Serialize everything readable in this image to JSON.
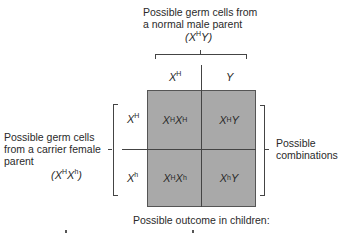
{
  "diagram": {
    "type": "punnett-square",
    "top_label": {
      "line1": "Possible germ cells from",
      "line2": "a normal male parent",
      "genotype": {
        "base1": "(X",
        "sup1": "H",
        "base2": "Y)"
      }
    },
    "column_headers": [
      {
        "base": "X",
        "sup": "H"
      },
      {
        "base": "Y",
        "sup": ""
      }
    ],
    "left_label": {
      "line1": "Possible germ cells",
      "line2": "from a carrier female",
      "line3": "parent",
      "genotype": {
        "base1": "(X",
        "sup1": "H",
        "base2": "X",
        "sup2": "h",
        "end": ")"
      }
    },
    "row_headers": [
      {
        "base": "X",
        "sup": "H"
      },
      {
        "base": "X",
        "sup": "h"
      }
    ],
    "cells": [
      {
        "a": "X",
        "a_sup": "H",
        "b": "X",
        "b_sup": "H"
      },
      {
        "a": "X",
        "a_sup": "H",
        "b": "Y",
        "b_sup": ""
      },
      {
        "a": "X",
        "a_sup": "H",
        "b": "X",
        "b_sup": "h"
      },
      {
        "a": "X",
        "a_sup": "h",
        "b": "Y",
        "b_sup": ""
      }
    ],
    "right_label": {
      "line1": "Possible",
      "line2": "combinations"
    },
    "bottom_label": "Possible outcome in children:",
    "colors": {
      "square_fill": "#a9a9a9",
      "lines": "#444444",
      "text": "#2a2a2a"
    }
  }
}
